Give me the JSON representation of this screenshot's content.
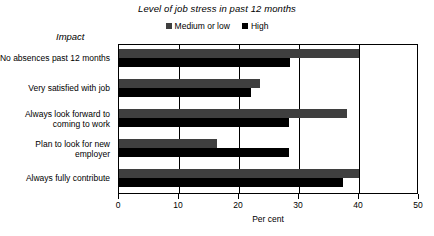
{
  "chart_data": {
    "type": "bar",
    "orientation": "horizontal",
    "title": "Level of job stress in past 12 months",
    "xlabel": "Per cent",
    "ylabel": "Impact",
    "xlim": [
      0,
      50
    ],
    "xticks": [
      0,
      10,
      20,
      30,
      40,
      50
    ],
    "grid": true,
    "legend_position": "top-center",
    "categories": [
      "No absences past 12 months",
      "Very satisfied with job",
      "Always look forward to coming to work",
      "Plan to look for new employer",
      "Always fully contribute"
    ],
    "series": [
      {
        "name": "Medium or low",
        "color": "#3f3f3f",
        "values": [
          40,
          23.5,
          38,
          16.3,
          40
        ]
      },
      {
        "name": "High",
        "color": "#000000",
        "values": [
          28.5,
          22,
          28.3,
          28.3,
          37.3
        ]
      }
    ]
  },
  "labels": {
    "category_lines": [
      [
        "No absences past 12 months"
      ],
      [
        "Very satisfied with job"
      ],
      [
        "Always look forward to",
        "coming to work"
      ],
      [
        "Plan to look for new",
        "employer"
      ],
      [
        "Always fully contribute"
      ]
    ]
  }
}
